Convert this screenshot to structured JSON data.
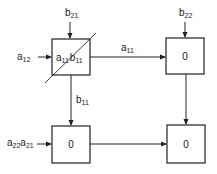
{
  "diagram": {
    "type": "systolic-array-dataflow",
    "colors": {
      "stroke": "#222222",
      "background": "#ffffff"
    },
    "cells": [
      {
        "id": "cell-00",
        "base1": "a",
        "sub1": "11",
        "base2": "b",
        "sub2": "11",
        "crossed": true
      },
      {
        "id": "cell-01",
        "value": "0"
      },
      {
        "id": "cell-10",
        "value": "0"
      },
      {
        "id": "cell-11",
        "value": "0"
      }
    ],
    "inputs": {
      "top_left": {
        "base": "b",
        "sub": "21"
      },
      "top_right": {
        "base": "b",
        "sub": "22"
      },
      "left_top": {
        "base": "a",
        "sub": "12"
      },
      "left_bottom": {
        "base1": "a",
        "sub1": "22",
        "base2": "a",
        "sub2": "21"
      }
    },
    "edges": {
      "horizontal_top": {
        "base": "a",
        "sub": "11"
      },
      "vertical_left": {
        "base": "b",
        "sub": "11"
      }
    }
  }
}
